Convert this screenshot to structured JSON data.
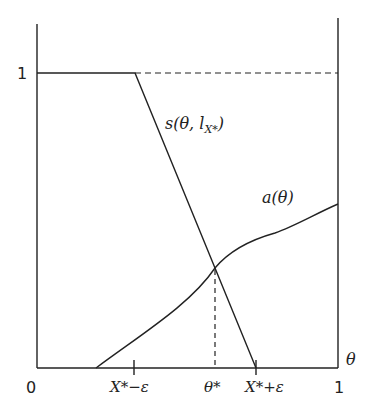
{
  "diagram": {
    "y_axis_label_1": "1",
    "x_origin_label": "0",
    "x_end_label": "1",
    "x_axis_var": "θ",
    "ticks": {
      "left": "X*−ε",
      "mid": "θ*",
      "right": "X*+ε"
    },
    "curve_s_label": "s(θ, l",
    "curve_s_sub": "X*",
    "curve_s_close": ")",
    "curve_a_label": "a(θ)",
    "colors": {
      "line": "#222222",
      "background": "#ffffff"
    }
  }
}
